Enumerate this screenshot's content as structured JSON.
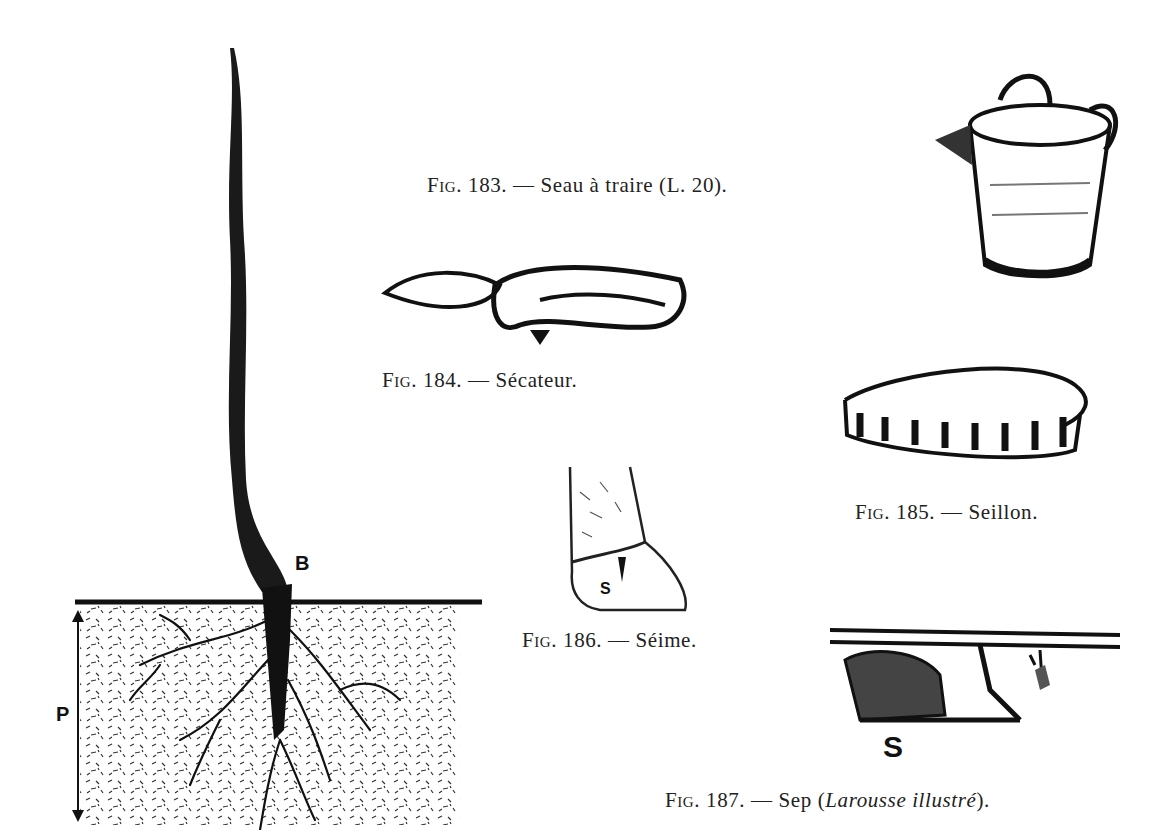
{
  "figures": [
    {
      "id": "fig183",
      "number": "183.",
      "prefix": "Fig.",
      "dash": "—",
      "title": "Seau à traire (L. 20).",
      "illustration": "milking-pail"
    },
    {
      "id": "fig184",
      "number": "184.",
      "prefix": "Fig.",
      "dash": "—",
      "title": "Sécateur.",
      "illustration": "pruning-shears"
    },
    {
      "id": "fig185",
      "number": "185.",
      "prefix": "Fig.",
      "dash": "—",
      "title": "Seillon.",
      "illustration": "shallow-tub"
    },
    {
      "id": "fig186",
      "number": "186.",
      "prefix": "Fig.",
      "dash": "—",
      "title": "Séime.",
      "illustration": "hoof-crack",
      "labels": [
        "S"
      ]
    },
    {
      "id": "fig187",
      "number": "187.",
      "prefix": "Fig.",
      "dash": "—",
      "title_plain": "Sep (",
      "title_italic": "Larousse illustré",
      "title_end": ").",
      "illustration": "plough-sole",
      "labels": [
        "S"
      ]
    }
  ],
  "vine_diagram": {
    "illustration": "vine-stock-planted",
    "labels": {
      "graft_point": "B",
      "depth": "P"
    }
  }
}
